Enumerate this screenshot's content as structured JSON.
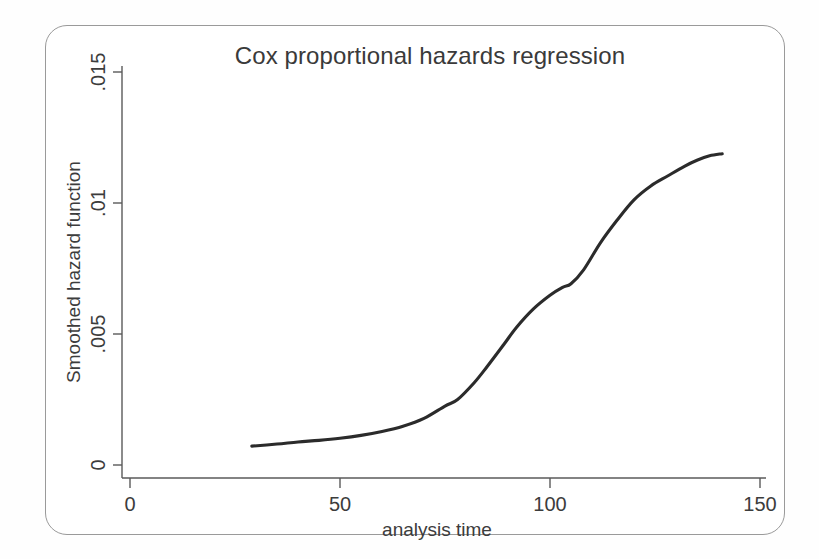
{
  "figure": {
    "title": "Cox proportional hazards regression",
    "frame_border_color": "#9a9a9a",
    "background_color": "#ffffff",
    "curve_color": "#2b2b2b",
    "axis_color": "#5a5a5a"
  },
  "axes": {
    "x_title": "analysis time",
    "y_title": "Smoothed hazard function",
    "x_ticks": [
      "0",
      "50",
      "100",
      "150"
    ],
    "y_ticks": [
      "0",
      ".005",
      ".01",
      ".015"
    ]
  },
  "chart_data": {
    "type": "line",
    "title": "Cox proportional hazards regression",
    "xlabel": "analysis time",
    "ylabel": "Smoothed hazard function",
    "xlim": [
      0,
      150
    ],
    "ylim": [
      0,
      0.015
    ],
    "xticks": [
      0,
      50,
      100,
      150
    ],
    "xticklabels": [
      "0",
      "50",
      "100",
      "150"
    ],
    "yticks": [
      0,
      0.005,
      0.01,
      0.015
    ],
    "yticklabels": [
      "0",
      ".005",
      ".01",
      ".015"
    ],
    "grid": false,
    "legend": false,
    "series": [
      {
        "name": "Smoothed hazard function",
        "color": "#2b2b2b",
        "x": [
          29,
          35,
          40,
          45,
          50,
          55,
          60,
          65,
          70,
          75,
          78,
          82,
          85,
          89,
          92,
          96,
          100,
          103,
          105,
          108,
          112,
          116,
          120,
          124,
          128,
          132,
          135,
          138,
          141
        ],
        "y": [
          0.00072,
          0.0008,
          0.00088,
          0.00094,
          0.00102,
          0.00113,
          0.00128,
          0.00148,
          0.00178,
          0.00225,
          0.0025,
          0.00315,
          0.00375,
          0.0046,
          0.00525,
          0.00595,
          0.00648,
          0.00678,
          0.00692,
          0.00745,
          0.00848,
          0.00935,
          0.01012,
          0.01065,
          0.01103,
          0.0114,
          0.01163,
          0.0118,
          0.01188
        ]
      }
    ]
  }
}
